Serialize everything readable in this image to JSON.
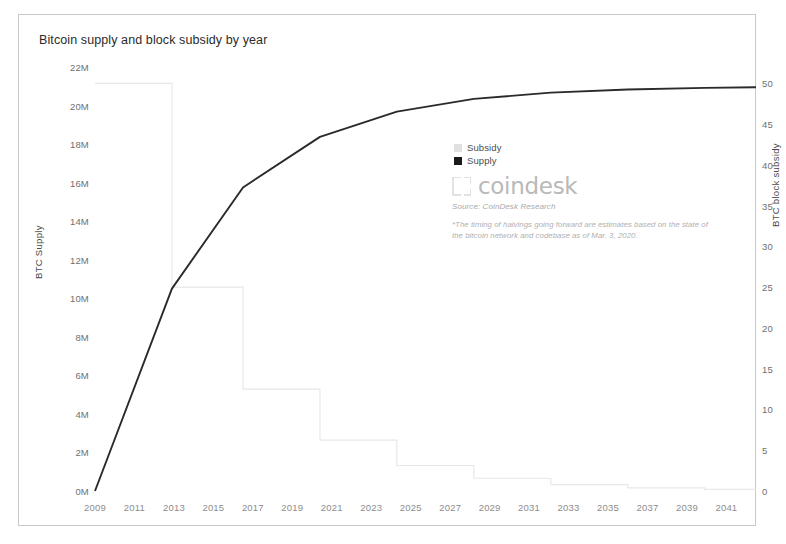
{
  "chart_data": {
    "type": "line",
    "title": "Bitcoin supply and block subsidy by year",
    "xlabel": "",
    "ylabel": "BTC Supply",
    "ylabel_right": "BTC block subsidy",
    "xlim": [
      2009,
      2042.5
    ],
    "ylim": [
      0,
      22000000
    ],
    "ylim_right": [
      0,
      52
    ],
    "grid": false,
    "legend_position": "center",
    "x_ticks": [
      2009,
      2011,
      2013,
      2015,
      2017,
      2019,
      2021,
      2023,
      2025,
      2027,
      2029,
      2031,
      2033,
      2035,
      2037,
      2039,
      2041
    ],
    "y_ticks_left": [
      "0M",
      "2M",
      "4M",
      "6M",
      "8M",
      "10M",
      "12M",
      "14M",
      "16M",
      "18M",
      "20M",
      "22M"
    ],
    "y_ticks_left_values": [
      0,
      2000000,
      4000000,
      6000000,
      8000000,
      10000000,
      12000000,
      14000000,
      16000000,
      18000000,
      20000000,
      22000000
    ],
    "y_ticks_right": [
      "0",
      "5",
      "10",
      "15",
      "20",
      "25",
      "30",
      "35",
      "40",
      "45",
      "50"
    ],
    "y_ticks_right_values": [
      0,
      5,
      10,
      15,
      20,
      25,
      30,
      35,
      40,
      45,
      50
    ],
    "series": [
      {
        "name": "Subsidy",
        "type": "step",
        "axis": "right",
        "color": "#e8e8e8",
        "x": [
          2009,
          2012.9,
          2012.9,
          2016.5,
          2016.5,
          2020.4,
          2020.4,
          2024.3,
          2024.3,
          2028.2,
          2028.2,
          2032.1,
          2032.1,
          2036.0,
          2036.0,
          2039.9,
          2039.9,
          2042.5
        ],
        "values": [
          50,
          50,
          25,
          25,
          12.5,
          12.5,
          6.25,
          6.25,
          3.125,
          3.125,
          1.5625,
          1.5625,
          0.78125,
          0.78125,
          0.390625,
          0.390625,
          0.1953125,
          0.1953125
        ]
      },
      {
        "name": "Supply",
        "type": "line",
        "axis": "left",
        "color": "#2a2a2a",
        "x": [
          2009,
          2012.9,
          2016.5,
          2020.4,
          2024.3,
          2028.2,
          2032.1,
          2036.0,
          2039.9,
          2042.5
        ],
        "values": [
          0,
          10500000,
          15750000,
          18375000,
          19687500,
          20343750,
          20671875,
          20835937,
          20917968,
          20950000
        ]
      }
    ]
  },
  "legend": {
    "items": [
      {
        "label": "Subsidy",
        "color": "#e0e0e0"
      },
      {
        "label": "Supply",
        "color": "#1a1a1a"
      }
    ]
  },
  "brand": {
    "wordmark": "coindesk",
    "source": "Source: CoinDesk Research",
    "note": "*The timing of halvings going forward are estimates based on the state of the bitcoin network and codebase as of Mar. 3, 2020."
  }
}
